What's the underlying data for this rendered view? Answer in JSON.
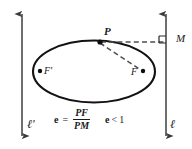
{
  "figure": {
    "stroke_color": "#1a1a1a",
    "dash_color": "#555555",
    "background": "#ffffff"
  },
  "labels": {
    "point_p": "P",
    "point_m": "M",
    "focus_left": "F'",
    "focus_right": "F",
    "directrix_left": "ℓ'",
    "directrix_right": "ℓ"
  },
  "formula": {
    "eccentricity_symbol": "e",
    "equals": "=",
    "numerator": "PF",
    "denominator": "PM",
    "inequality_symbol": "e",
    "inequality_operator": "<",
    "inequality_value": "1"
  },
  "geometry": {
    "ellipse": {
      "cx": 94,
      "cy": 71.5,
      "rx": 61,
      "ry": 31
    },
    "point_p": {
      "x": 100,
      "y": 42
    },
    "point_m": {
      "x": 166,
      "y": 42
    },
    "focus_left": {
      "x": 41,
      "y": 71
    },
    "focus_right": {
      "x": 142,
      "y": 71
    },
    "directrix_left_x": 22,
    "directrix_right_x": 166,
    "axis_top_y": 10,
    "axis_bottom_y": 140,
    "right_angle_marker": {
      "x": 159,
      "y": 36,
      "size": 7
    }
  }
}
